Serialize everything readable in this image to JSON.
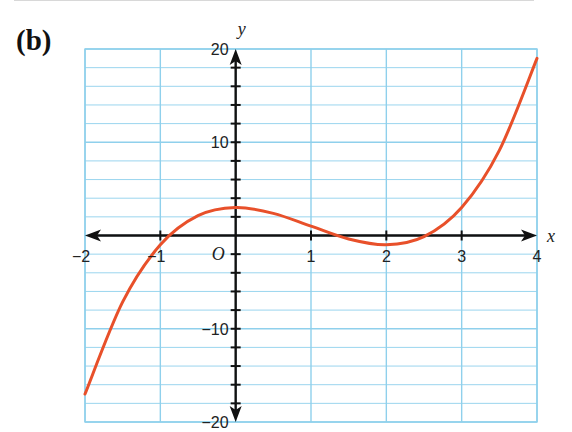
{
  "part_label": "(b)",
  "chart_data": {
    "type": "line",
    "title": "",
    "xlabel": "x",
    "ylabel": "y",
    "origin_label": "O",
    "xlim": [
      -2,
      4
    ],
    "ylim": [
      -20,
      20
    ],
    "grid": true,
    "x_major_grid_step": 1,
    "y_minor_grid_step": 2,
    "y_major_grid_step": 10,
    "x_ticks": [
      -2,
      -1,
      1,
      2,
      3,
      4
    ],
    "x_tick_labels": [
      "−2",
      "−1",
      "1",
      "2",
      "3",
      "4"
    ],
    "y_ticks": [
      20,
      10,
      -10,
      -20
    ],
    "y_tick_labels": [
      "20",
      "10",
      "−10",
      "−20"
    ],
    "y_minor_tick_step": 2,
    "series": [
      {
        "name": "y = x³ − 3x² + 3",
        "x": [
          -2,
          -1.5,
          -1,
          -0.5,
          0,
          0.5,
          1,
          1.5,
          2,
          2.5,
          3,
          3.5,
          4
        ],
        "y": [
          -17,
          -7.125,
          -1,
          2.125,
          3,
          2.375,
          1,
          -0.375,
          -1,
          -0.125,
          3,
          9.125,
          19
        ],
        "color": "#e8502a"
      }
    ],
    "colors": {
      "grid": "#8fd0ec",
      "axis": "#111111",
      "curve": "#e8502a"
    }
  }
}
